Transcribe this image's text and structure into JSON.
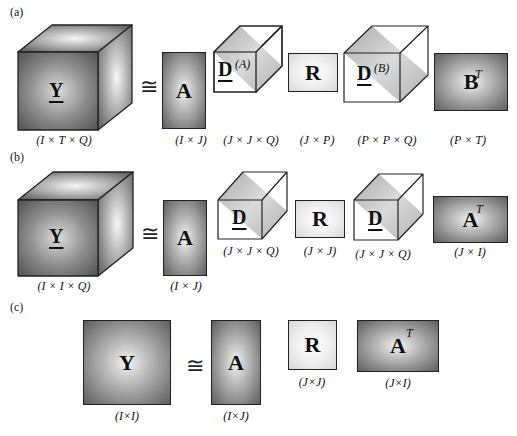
{
  "panels": {
    "a": {
      "label": "(a)",
      "approx": "≅",
      "Y": {
        "symbol": "Y",
        "dims": "(I × T × Q)"
      },
      "A": {
        "symbol": "A",
        "dims": "(I × J)"
      },
      "DA": {
        "symbol": "D",
        "superscript": "(A)",
        "dims": "(J × J × Q)"
      },
      "R": {
        "symbol": "R",
        "dims": "(J × P)"
      },
      "DB": {
        "symbol": "D",
        "superscript": "(B)",
        "dims": "(P × P × Q)"
      },
      "BT": {
        "symbol": "B",
        "superscript": "T",
        "dims": "(P × T)"
      }
    },
    "b": {
      "label": "(b)",
      "approx": "≅",
      "Y": {
        "symbol": "Y",
        "dims": "(I × I × Q)"
      },
      "A": {
        "symbol": "A",
        "dims": "(I × J)"
      },
      "D1": {
        "symbol": "D",
        "dims": "(J × J × Q)"
      },
      "R": {
        "symbol": "R",
        "dims": "(J × J)"
      },
      "D2": {
        "symbol": "D",
        "dims": "(J × J × Q)"
      },
      "AT": {
        "symbol": "A",
        "superscript": "T",
        "dims": "(J × I)"
      }
    },
    "c": {
      "label": "(c)",
      "approx": "≅",
      "Y": {
        "symbol": "Y",
        "dims": "(I×I)"
      },
      "A": {
        "symbol": "A",
        "dims": "(I×J)"
      },
      "R": {
        "symbol": "R",
        "dims": "(J×J)"
      },
      "AT": {
        "symbol": "A",
        "superscript": "T",
        "dims": "(J×I)"
      }
    }
  },
  "colors": {
    "stroke": "#222222",
    "dark_fill": "#7a7a7a",
    "light_fill": "#f0f0f0",
    "diag_fill": "#b8b8b8"
  }
}
